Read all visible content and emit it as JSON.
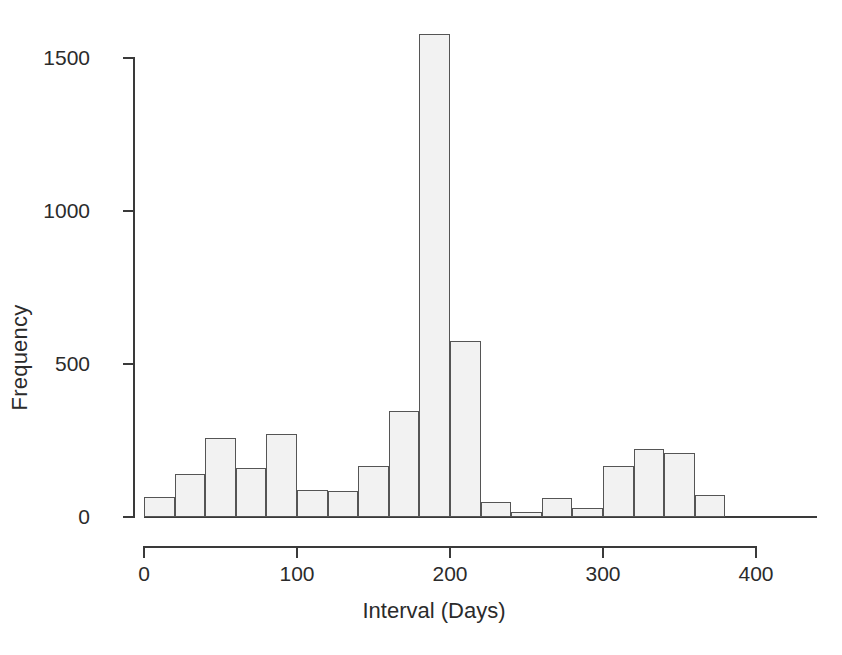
{
  "chart_data": {
    "type": "bar",
    "title": "",
    "subtitle": "",
    "xlabel": "Interval (Days)",
    "ylabel": "Frequency",
    "bin_width": 20,
    "xlim": [
      0,
      440
    ],
    "ylim": [
      0,
      1600
    ],
    "grid": false,
    "legend": null,
    "x_ticks": [
      0,
      100,
      200,
      300,
      400
    ],
    "x_tick_labels": [
      "0",
      "100",
      "200",
      "300",
      "400"
    ],
    "y_ticks": [
      0,
      500,
      1000,
      1500
    ],
    "y_tick_labels": [
      "0",
      "500",
      "1000",
      "1500"
    ],
    "bin_edges": [
      0,
      20,
      40,
      60,
      80,
      100,
      120,
      140,
      160,
      180,
      200,
      220,
      240,
      260,
      280,
      300,
      320,
      340,
      360,
      380,
      400,
      420,
      440
    ],
    "categories": [
      "0-20",
      "20-40",
      "40-60",
      "60-80",
      "80-100",
      "100-120",
      "120-140",
      "140-160",
      "160-180",
      "180-200",
      "200-220",
      "220-240",
      "240-260",
      "260-280",
      "280-300",
      "300-320",
      "320-340",
      "340-360",
      "360-380",
      "380-400",
      "400-420",
      "420-440"
    ],
    "values": [
      65,
      140,
      258,
      160,
      272,
      88,
      85,
      168,
      345,
      1580,
      575,
      50,
      15,
      62,
      28,
      168,
      222,
      208,
      72,
      0,
      0,
      0
    ],
    "bar_fill_color": "#f2f2f2",
    "bar_edge_color": "#555555",
    "axis_color": "#3a3a3a",
    "background_color": "#ffffff"
  }
}
